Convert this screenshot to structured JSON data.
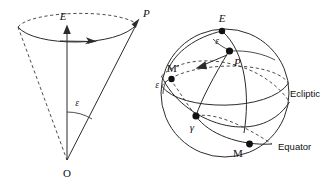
{
  "figure": {
    "background_color": "#ffffff",
    "line_color": "#2b2b2b",
    "point_color": "#111111",
    "width": 330,
    "height": 183
  },
  "left_panel": {
    "name": "precession-cone",
    "labels": {
      "apex": "O",
      "axis_top": "E",
      "pole": "P",
      "angle": "ε"
    },
    "description": "Cone with apex O, axis to E, slant edge to P, half-angle epsilon, circular base traced by arrow"
  },
  "right_panel": {
    "name": "celestial-sphere",
    "labels": {
      "ecliptic_pole": "E",
      "celestial_pole": "P",
      "mean_point": "M",
      "mean_point_prime": "M'",
      "vernal_equinox": "γ",
      "angle_at_pole": "ε",
      "angle_at_equinox": "ε",
      "ecliptic": "Ecliptic",
      "equator": "Equator"
    },
    "description": "Sphere showing ecliptic and equator great circles intersecting at gamma with obliquity epsilon"
  }
}
